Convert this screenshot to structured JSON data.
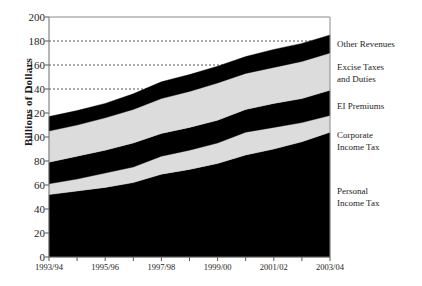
{
  "chart_data": {
    "type": "area",
    "stacked": true,
    "title": "",
    "xlabel": "",
    "ylabel": "Billions of Dollars",
    "ylim": [
      0,
      200
    ],
    "ytick_step": 20,
    "yticks": [
      0,
      20,
      40,
      60,
      80,
      100,
      120,
      140,
      160,
      180,
      200
    ],
    "ytick_labels": [
      "0",
      "20",
      "40",
      "60",
      "80",
      "100",
      "120",
      "140",
      "160",
      "180",
      "200"
    ],
    "grid": "dotted-horizontal",
    "gridlines": [
      140,
      160,
      180
    ],
    "x": [
      "1993/94",
      "1994/95",
      "1995/96",
      "1996/97",
      "1997/98",
      "1998/99",
      "1999/00",
      "2000/01",
      "2001/02",
      "2002/03",
      "2003/04"
    ],
    "xtick_labels": [
      "1993/94",
      "1995/96",
      "1997/98",
      "1999/00",
      "2001/02",
      "2003/04"
    ],
    "xtick_values": [
      "1993/94",
      "1995/96",
      "1997/98",
      "1999/00",
      "2001/02",
      "2003/04"
    ],
    "legend_position": "right-outside",
    "series": [
      {
        "name": "Personal Income Tax",
        "color": "#000000",
        "values": [
          52,
          55,
          58,
          62,
          69,
          73,
          78,
          85,
          90,
          96,
          104
        ]
      },
      {
        "name": "Corporate Income Tax",
        "color": "#dcdcdc",
        "values": [
          9,
          10,
          12,
          13,
          15,
          16,
          17,
          19,
          18,
          16,
          14
        ]
      },
      {
        "name": "EI Premiums",
        "color": "#000000",
        "values": [
          18,
          19,
          19,
          20,
          19,
          19,
          19,
          19,
          20,
          20,
          21
        ]
      },
      {
        "name": "Excise Taxes and Duties",
        "color": "#dcdcdc",
        "values": [
          26,
          26,
          27,
          28,
          29,
          30,
          31,
          30,
          30,
          31,
          31
        ]
      },
      {
        "name": "Other Revenues",
        "color": "#000000",
        "values": [
          12,
          12,
          12,
          13,
          14,
          14,
          14,
          14,
          15,
          15,
          15
        ]
      }
    ],
    "cumulative_tops": {
      "Personal Income Tax": [
        52,
        55,
        58,
        62,
        69,
        73,
        78,
        85,
        90,
        96,
        104
      ],
      "Corporate Income Tax": [
        61,
        65,
        70,
        75,
        84,
        89,
        95,
        104,
        108,
        112,
        118
      ],
      "EI Premiums": [
        79,
        84,
        89,
        95,
        103,
        108,
        114,
        123,
        128,
        132,
        139
      ],
      "Excise Taxes and Duties": [
        105,
        110,
        116,
        123,
        132,
        138,
        145,
        153,
        158,
        163,
        170
      ],
      "Other Revenues": [
        117,
        122,
        128,
        136,
        146,
        152,
        159,
        167,
        173,
        178,
        185
      ]
    }
  },
  "legend": {
    "items": [
      {
        "label": "Other Revenues"
      },
      {
        "label": "Excise Taxes\nand Duties"
      },
      {
        "label": "EI Premiums"
      },
      {
        "label": "Corporate\nIncome Tax"
      },
      {
        "label": "Personal\nIncome Tax"
      }
    ]
  }
}
